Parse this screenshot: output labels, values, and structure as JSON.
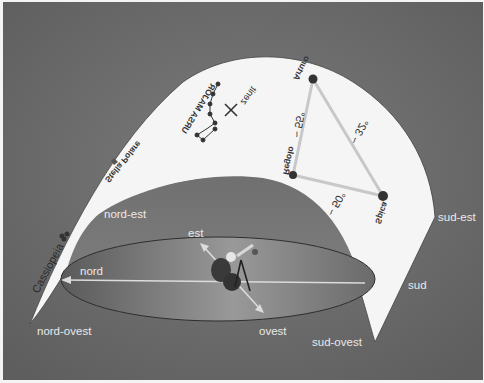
{
  "diagram": {
    "language": "Italian",
    "colors": {
      "background": "#6e6e6e",
      "sky_band": "#f5f5f5",
      "inner_dome": "#7a7a7a",
      "horizon_disk": "#8a8a8a",
      "lines": "#d8d8d8",
      "star": "#333333"
    },
    "directions": {
      "nord_est": "nord-est",
      "est": "est",
      "nord": "nord",
      "nord_ovest": "nord-ovest",
      "ovest": "ovest",
      "sud_ovest": "sud-ovest",
      "sud": "sud",
      "sud_est": "sud-est"
    },
    "sky_labels": {
      "stella_polare": "Stella Polare",
      "ursa_major": "URSA MAJOR",
      "zenit": "zenit",
      "cassiopeia": "Cassiopeia"
    },
    "stars": {
      "arturo": "Arturo",
      "regolo": "Regolo",
      "spica": "Spica"
    },
    "angles": {
      "arturo_regolo": "~ 55°",
      "arturo_spica": "~ 32°",
      "regolo_spica": "~ 50°"
    }
  }
}
